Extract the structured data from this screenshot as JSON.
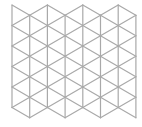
{
  "diagram": {
    "type": "triangular-lattice",
    "columns": 8,
    "segments_per_column": 5,
    "origin_x": 12,
    "column_spacing": 17.7,
    "side_length": 20.5,
    "even_column_top": 5,
    "odd_column_top": 15.25,
    "colors": {
      "background": "#ffffff",
      "line": "#a9a9a9"
    },
    "line_width": 1.2
  }
}
